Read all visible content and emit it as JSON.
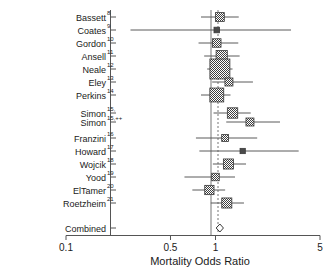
{
  "chart_data": {
    "type": "forest",
    "title": "",
    "xlabel": "Mortality Odds Ratio",
    "ylabel": "",
    "xscale": "log",
    "xlim": [
      0.1,
      5
    ],
    "xticks": [
      0.1,
      0.5,
      1,
      5
    ],
    "xticklabels": [
      "0.1",
      "0.5",
      "1",
      "5"
    ],
    "grid": false,
    "legend": null,
    "null_line": 1.0,
    "pooled_line": 1.07,
    "studies": [
      {
        "label": "Bassett",
        "ref": "8",
        "or": 1.07,
        "lo": 0.8,
        "hi": 1.43,
        "weight": 0.3
      },
      {
        "label": "Coates",
        "ref": "9",
        "or": 1.02,
        "lo": 0.27,
        "hi": 3.2,
        "weight": 0.1
      },
      {
        "label": "Gordon",
        "ref": "10",
        "or": 1.02,
        "lo": 0.77,
        "hi": 1.42,
        "weight": 0.28
      },
      {
        "label": "Ansell",
        "ref": "11",
        "or": 1.1,
        "lo": 0.84,
        "hi": 1.45,
        "weight": 0.45
      },
      {
        "label": "Neale",
        "ref": "12",
        "or": 1.07,
        "lo": 0.88,
        "hi": 1.3,
        "weight": 1.0
      },
      {
        "label": "Eley",
        "ref": "13",
        "or": 1.23,
        "lo": 0.95,
        "hi": 1.78,
        "weight": 0.25
      },
      {
        "label": "Perkins",
        "ref": "14",
        "or": 1.02,
        "lo": 0.8,
        "hi": 1.26,
        "weight": 0.62
      },
      {
        "label": "Simon",
        "ref": "15,",
        "or": 1.3,
        "lo": 0.97,
        "hi": 1.72,
        "weight": 0.4
      },
      {
        "label": "Simon",
        "ref": "15,++",
        "or": 1.7,
        "lo": 1.18,
        "hi": 2.7,
        "weight": 0.25
      },
      {
        "label": "Franzini",
        "ref": "16",
        "or": 1.16,
        "lo": 0.74,
        "hi": 1.9,
        "weight": 0.18
      },
      {
        "label": "Howard",
        "ref": "17",
        "or": 1.52,
        "lo": 0.78,
        "hi": 3.6,
        "weight": 0.08
      },
      {
        "label": "Wojcik",
        "ref": "18",
        "or": 1.22,
        "lo": 0.96,
        "hi": 1.6,
        "weight": 0.38
      },
      {
        "label": "Yood",
        "ref": "19",
        "or": 1.0,
        "lo": 0.62,
        "hi": 1.35,
        "weight": 0.22
      },
      {
        "label": "ElTamer",
        "ref": "20",
        "or": 0.91,
        "lo": 0.7,
        "hi": 1.16,
        "weight": 0.33
      },
      {
        "label": "Roetzheim",
        "ref": "21",
        "or": 1.19,
        "lo": 0.93,
        "hi": 1.55,
        "weight": 0.38
      }
    ],
    "combined": {
      "label": "Combined",
      "or": 1.07,
      "lo": 1.01,
      "hi": 1.13
    }
  },
  "axis": {
    "xlabel": "Mortality Odds Ratio",
    "ticks": [
      "0.1",
      "0.5",
      "1",
      "5"
    ]
  }
}
